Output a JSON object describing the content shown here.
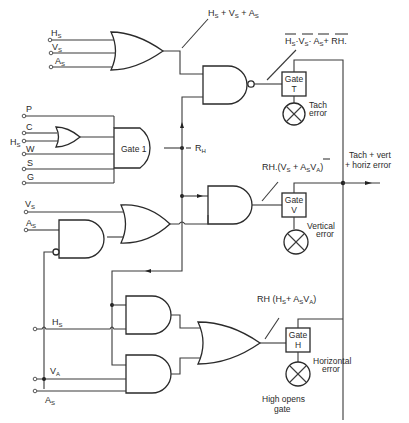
{
  "diagram": {
    "type": "logic-circuit",
    "inputs_top": [
      {
        "main": "H",
        "sub": "S"
      },
      {
        "main": "V",
        "sub": "S"
      },
      {
        "main": "A",
        "sub": "S"
      }
    ],
    "inputs_gate1": [
      {
        "main": "P",
        "sub": ""
      },
      {
        "main": "C",
        "sub": ""
      },
      {
        "main": "H",
        "sub": "S"
      },
      {
        "main": "W",
        "sub": ""
      },
      {
        "main": "S",
        "sub": ""
      },
      {
        "main": "G",
        "sub": ""
      }
    ],
    "inputs_mid": [
      {
        "main": "V",
        "sub": "S"
      },
      {
        "main": "A",
        "sub": "S"
      }
    ],
    "inputs_bottom": [
      {
        "main": "H",
        "sub": "S"
      },
      {
        "main": "V",
        "sub": "A"
      },
      {
        "main": "A",
        "sub": "S"
      }
    ],
    "gate1_label": "Gate 1",
    "rh_label": "R",
    "rh_sub": "H",
    "expr_or_top": "Hₛ + Vₛ + Aₛ",
    "expr_or_top_parts": {
      "h": "H",
      "v": "V",
      "a": "A",
      "s": "S",
      "plus": "+"
    },
    "expr_tach": {
      "text": "Hₛ·Vₛ·Aₛ+ RH.",
      "h": "H",
      "v": "V",
      "a": "A",
      "s": "S",
      "dot": "·",
      "plus": "+ ",
      "rh": "RH."
    },
    "expr_vert": {
      "pre": "RH.(V",
      "s": "S",
      "mid": " + A",
      "s2": "S",
      "va": "V",
      "a": "A",
      "post": ")"
    },
    "expr_horiz": {
      "pre": "RH (H",
      "s": "S",
      "mid": "+ A",
      "s2": "S",
      "va": "V",
      "a": "A",
      "post": ")"
    },
    "gate_t": {
      "line1": "Gate",
      "line2": "T"
    },
    "gate_v": {
      "line1": "Gate",
      "line2": "V"
    },
    "gate_h": {
      "line1": "Gate",
      "line2": "H"
    },
    "lamp_tach": {
      "line1": "Tach",
      "line2": "error"
    },
    "lamp_vert": {
      "line1": "Vertical",
      "line2": "error"
    },
    "lamp_horiz": {
      "line1": "Horizontal",
      "line2": "error"
    },
    "output_label": {
      "line1": "Tach  + vert",
      "line2": "+ horiz error"
    },
    "note": {
      "line1": "High opens",
      "line2": "gate"
    }
  }
}
